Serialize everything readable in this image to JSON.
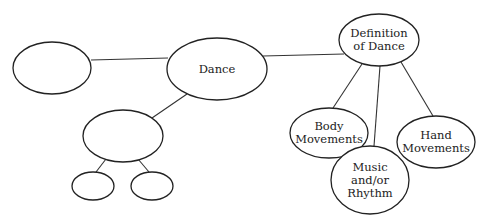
{
  "diagram": {
    "type": "concept-map",
    "nodes": [
      {
        "id": "left-empty",
        "label": "",
        "cx": 52,
        "cy": 68,
        "rx": 39,
        "ry": 26
      },
      {
        "id": "dance",
        "label": "Dance",
        "cx": 217,
        "cy": 69,
        "rx": 50,
        "ry": 31
      },
      {
        "id": "definition",
        "label": "Definition of Dance",
        "lines": [
          "Definition",
          "of Dance"
        ],
        "cx": 379,
        "cy": 40,
        "rx": 40,
        "ry": 26
      },
      {
        "id": "lower-empty",
        "label": "",
        "cx": 123,
        "cy": 136,
        "rx": 40,
        "ry": 26
      },
      {
        "id": "small-left-empty",
        "label": "",
        "cx": 93,
        "cy": 186,
        "rx": 21,
        "ry": 14
      },
      {
        "id": "small-right-empty",
        "label": "",
        "cx": 152,
        "cy": 186,
        "rx": 21,
        "ry": 14
      },
      {
        "id": "body",
        "label": "Body Movements",
        "lines": [
          "Body",
          "Movements"
        ],
        "cx": 329,
        "cy": 133,
        "rx": 39,
        "ry": 25
      },
      {
        "id": "music",
        "label": "Music and/or Rhythm",
        "lines": [
          "Music",
          "and/or",
          "Rhythm"
        ],
        "cx": 370,
        "cy": 180,
        "rx": 39,
        "ry": 34
      },
      {
        "id": "hand",
        "label": "Hand Movements",
        "lines": [
          "Hand",
          "Movements"
        ],
        "cx": 436,
        "cy": 142,
        "rx": 39,
        "ry": 26
      }
    ],
    "edges": [
      {
        "from": "left-empty",
        "to": "dance",
        "x1": 91,
        "y1": 60,
        "x2": 168,
        "y2": 58
      },
      {
        "from": "dance",
        "to": "definition",
        "x1": 263,
        "y1": 56,
        "x2": 344,
        "y2": 54
      },
      {
        "from": "dance",
        "to": "lower-empty",
        "x1": 187,
        "y1": 94,
        "x2": 152,
        "y2": 118
      },
      {
        "from": "lower-empty",
        "to": "small-left-empty",
        "x1": 106,
        "y1": 159,
        "x2": 96,
        "y2": 172
      },
      {
        "from": "lower-empty",
        "to": "small-right-empty",
        "x1": 138,
        "y1": 159,
        "x2": 149,
        "y2": 172
      },
      {
        "from": "definition",
        "to": "body",
        "x1": 362,
        "y1": 64,
        "x2": 333,
        "y2": 108
      },
      {
        "from": "definition",
        "to": "music",
        "x1": 380,
        "y1": 66,
        "x2": 374,
        "y2": 146
      },
      {
        "from": "definition",
        "to": "hand",
        "x1": 401,
        "y1": 62,
        "x2": 433,
        "y2": 116
      }
    ],
    "colors": {
      "stroke": "#222222",
      "background": "#ffffff",
      "text": "#222222"
    }
  },
  "labels": {
    "dance": "Dance",
    "definition_l1": "Definition",
    "definition_l2": "of Dance",
    "body_l1": "Body",
    "body_l2": "Movements",
    "music_l1": "Music",
    "music_l2": "and/or",
    "music_l3": "Rhythm",
    "hand_l1": "Hand",
    "hand_l2": "Movements"
  }
}
